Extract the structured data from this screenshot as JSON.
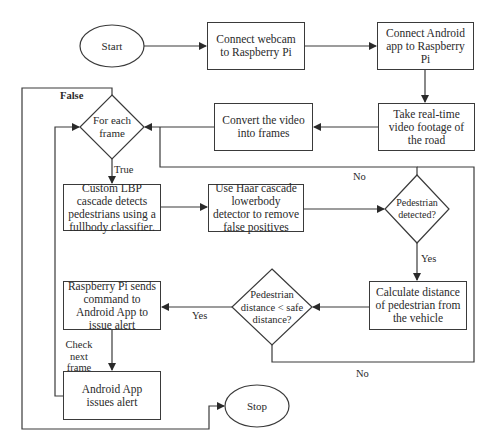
{
  "diagram": {
    "type": "flowchart",
    "colors": {
      "stroke": "#3a3a3a",
      "background": "#ffffff",
      "text": "#2a2a2a"
    },
    "terminals": {
      "start": "Start",
      "stop": "Stop"
    },
    "processes": {
      "connect_webcam": "Connect webcam to Raspberry Pi",
      "connect_android": "Connect Android app to Raspberry Pi",
      "take_footage": "Take real-time video footage of the road",
      "convert_video": "Convert the video into frames",
      "lbp_cascade": "Custom LBP cascade detects pedestrians using a fullbody classifier.",
      "haar_cascade": "Use Haar cascade lowerbody detector to remove false positives",
      "calc_distance": "Calculate distance of pedestrian from the vehicle",
      "send_command": "Raspberry Pi sends command to Android App to issue alert",
      "issue_alert": "Android App issues alert"
    },
    "decisions": {
      "for_each_frame": "For each frame",
      "pedestrian_detected": "Pedestrian detected?",
      "distance_check": "Pedestrian distance < safe distance?"
    },
    "edge_labels": {
      "false": "False",
      "true": "True",
      "no_detected": "No",
      "yes_detected": "Yes",
      "yes_distance": "Yes",
      "no_distance": "No",
      "check_next_frame": "Check next frame"
    }
  }
}
